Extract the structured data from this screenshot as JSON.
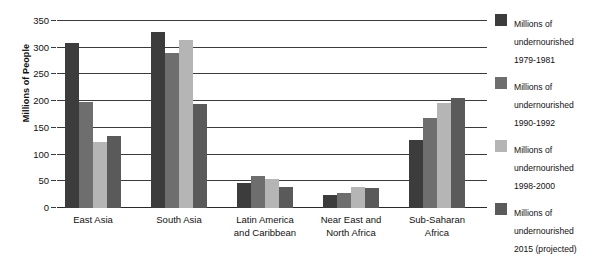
{
  "chart_data": {
    "type": "bar",
    "title": "",
    "xlabel": "",
    "ylabel": "Millions of People",
    "ylim": [
      0,
      350
    ],
    "yticks": [
      0,
      50,
      100,
      150,
      200,
      250,
      300,
      350
    ],
    "ytick_labels": [
      "0",
      "50",
      "100",
      "150",
      "200",
      "250",
      "300",
      "350"
    ],
    "grid": true,
    "legend_position": "right",
    "categories": [
      "East Asia",
      "South Asia",
      "Latin America\nand Caribbean",
      "Near East and\nNorth Africa",
      "Sub-Saharan\nAfrica"
    ],
    "series": [
      {
        "name": "Millions of\nundernourished\n1979-1981",
        "color": "#3c3c3c",
        "values": [
          308,
          330,
          46,
          24,
          128
        ]
      },
      {
        "name": "Millions of\nundernourished\n1990-1992",
        "color": "#6e6e6e",
        "values": [
          199,
          291,
          59,
          28,
          168
        ]
      },
      {
        "name": "Millions of\nundernourished\n1998-2000",
        "color": "#b5b5b5",
        "values": [
          123,
          314,
          54,
          40,
          196
        ]
      },
      {
        "name": "Millions of\nundernourished\n2015 (projected)",
        "color": "#5a5a5a",
        "values": [
          135,
          195,
          40,
          38,
          206
        ]
      }
    ]
  }
}
